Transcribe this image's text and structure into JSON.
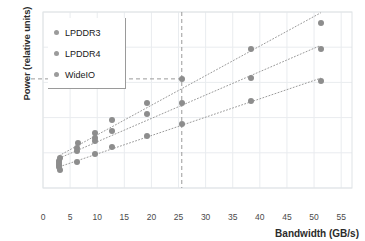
{
  "chart_data": {
    "type": "scatter",
    "title": "",
    "xlabel": "Bandwidth (GB/s)",
    "ylabel": "Power (relative units)",
    "xlim": [
      0,
      57
    ],
    "ylim": [
      0,
      100
    ],
    "xticks": [
      0,
      5,
      10,
      15,
      20,
      25,
      30,
      35,
      40,
      45,
      50,
      55
    ],
    "xticklabels": [
      "0",
      "5",
      "10",
      "15",
      "20",
      "25",
      "30",
      "35",
      "40",
      "45",
      "50",
      "55"
    ],
    "yticks": [],
    "yticklabels": [],
    "grid": true,
    "legend_position": "upper-left",
    "marker_color": "#8d8d8d",
    "trendline_style": "dotted",
    "annotations": {
      "vline_x": 25.6,
      "hline_y": 62.0,
      "guide_style": "dashed",
      "guide_color": "#9a9a9a"
    },
    "series": [
      {
        "name": "LPDDR3",
        "color": "#8d8d8d",
        "points": [
          {
            "x": 3.0,
            "y": 13.0
          },
          {
            "x": 3.0,
            "y": 15.5
          },
          {
            "x": 3.1,
            "y": 17.0
          },
          {
            "x": 6.3,
            "y": 23.0
          },
          {
            "x": 6.4,
            "y": 25.5
          },
          {
            "x": 9.6,
            "y": 31.0
          },
          {
            "x": 12.7,
            "y": 38.5
          },
          {
            "x": 19.1,
            "y": 48.5
          },
          {
            "x": 25.6,
            "y": 62.0
          },
          {
            "x": 38.3,
            "y": 79.0
          },
          {
            "x": 51.2,
            "y": 94.0
          }
        ]
      },
      {
        "name": "LPDDR4",
        "color": "#8d8d8d",
        "points": [
          {
            "x": 3.0,
            "y": 12.0
          },
          {
            "x": 3.0,
            "y": 14.0
          },
          {
            "x": 6.3,
            "y": 21.0
          },
          {
            "x": 9.5,
            "y": 26.5
          },
          {
            "x": 9.6,
            "y": 28.5
          },
          {
            "x": 12.7,
            "y": 32.5
          },
          {
            "x": 19.1,
            "y": 42.0
          },
          {
            "x": 25.6,
            "y": 48.5
          },
          {
            "x": 38.3,
            "y": 62.5
          },
          {
            "x": 51.2,
            "y": 79.0
          }
        ]
      },
      {
        "name": "WideIO",
        "color": "#8d8d8d",
        "points": [
          {
            "x": 3.1,
            "y": 10.0
          },
          {
            "x": 6.3,
            "y": 15.0
          },
          {
            "x": 9.6,
            "y": 19.5
          },
          {
            "x": 12.7,
            "y": 23.5
          },
          {
            "x": 19.1,
            "y": 29.5
          },
          {
            "x": 25.6,
            "y": 36.5
          },
          {
            "x": 38.3,
            "y": 49.5
          },
          {
            "x": 51.2,
            "y": 61.0
          }
        ]
      }
    ]
  },
  "legend": {
    "items": [
      {
        "label": "LPDDR3"
      },
      {
        "label": "LPDDR4"
      },
      {
        "label": "WideIO"
      }
    ]
  },
  "axes": {
    "x_title": "Bandwidth (GB/s)",
    "y_title": "Power (relative units)"
  }
}
